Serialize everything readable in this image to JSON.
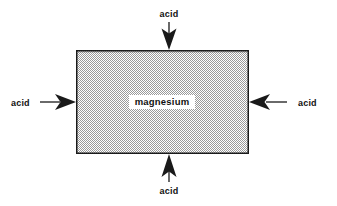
{
  "diagram": {
    "block": {
      "label": "magnesium",
      "fill_color": "#cfcfcf",
      "border_color": "#1a1a1a",
      "x": 76,
      "y": 50,
      "width": 173,
      "height": 104
    },
    "background_color": "#ffffff",
    "arrow_color": "#1a1a1a",
    "labels": {
      "top": "acid",
      "bottom": "acid",
      "left": "acid",
      "right": "acid"
    },
    "arrows": [
      {
        "name": "arrow-top",
        "direction": "down",
        "label": "acid"
      },
      {
        "name": "arrow-bottom",
        "direction": "up",
        "label": "acid"
      },
      {
        "name": "arrow-left",
        "direction": "right",
        "label": "acid"
      },
      {
        "name": "arrow-right",
        "direction": "left",
        "label": "acid"
      }
    ]
  }
}
